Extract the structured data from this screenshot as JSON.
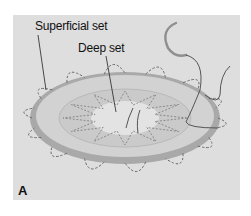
{
  "figure": {
    "panel_letter": "A",
    "labels": {
      "superficial": "Superficial set",
      "deep": "Deep set"
    },
    "colors": {
      "background": "#dedede",
      "disc_rim": "#a9a9a9",
      "disc_face": "#cfcfcf",
      "suture": "#555555",
      "needle": "#9a9a9a"
    }
  }
}
